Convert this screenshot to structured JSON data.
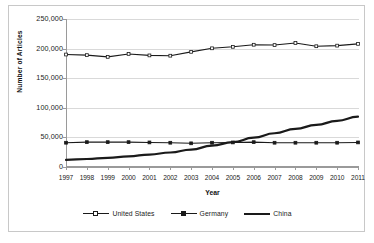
{
  "chart_data": {
    "type": "line",
    "title": "",
    "xlabel": "Year",
    "ylabel": "Number of Articles",
    "categories": [
      "1997",
      "1998",
      "1999",
      "2000",
      "2001",
      "2002",
      "2003",
      "2004",
      "2005",
      "2006",
      "2007",
      "2008",
      "2009",
      "2010",
      "2011"
    ],
    "x": [
      1997,
      1998,
      1999,
      2000,
      2001,
      2002,
      2003,
      2004,
      2005,
      2006,
      2007,
      2008,
      2009,
      2010,
      2011
    ],
    "ylim": [
      0,
      250000
    ],
    "xlim": [
      1997,
      2011
    ],
    "ytick_labels": [
      "250,000",
      "200,000",
      "150,000",
      "100,000",
      "50,000",
      "0"
    ],
    "ytick_values": [
      250000,
      200000,
      150000,
      100000,
      50000,
      0
    ],
    "grid": true,
    "legend_position": "bottom",
    "series": [
      {
        "name": "United States",
        "marker": "open-square",
        "values": [
          190000,
          189000,
          186000,
          191000,
          188500,
          188000,
          194500,
          200500,
          203000,
          206500,
          206000,
          209500,
          204000,
          205000,
          208000
        ]
      },
      {
        "name": "Germany",
        "marker": "filled-square",
        "values": [
          41000,
          42000,
          42000,
          42000,
          41500,
          41000,
          40000,
          41000,
          41500,
          42000,
          41000,
          41000,
          41000,
          41000,
          41500
        ]
      },
      {
        "name": "China",
        "marker": "none",
        "values": [
          12000,
          13500,
          15500,
          18000,
          21000,
          24500,
          29500,
          36000,
          42000,
          49500,
          57000,
          64500,
          71000,
          78000,
          85000
        ]
      }
    ]
  },
  "axes": {
    "y_title": "Number of Articles",
    "x_title": "Year"
  },
  "legend": {
    "items": [
      {
        "label": "United States",
        "marker": "open-square",
        "style": "thin"
      },
      {
        "label": "Germany",
        "marker": "filled-square",
        "style": "thin"
      },
      {
        "label": "China",
        "marker": "none",
        "style": "thick"
      }
    ]
  },
  "colors": {
    "series_line": "#1a1a1a",
    "gridline": "#d9d9d9",
    "axis": "#9a9a9a",
    "text": "#222222",
    "frame": "#c8c8c8",
    "background": "#ffffff"
  }
}
